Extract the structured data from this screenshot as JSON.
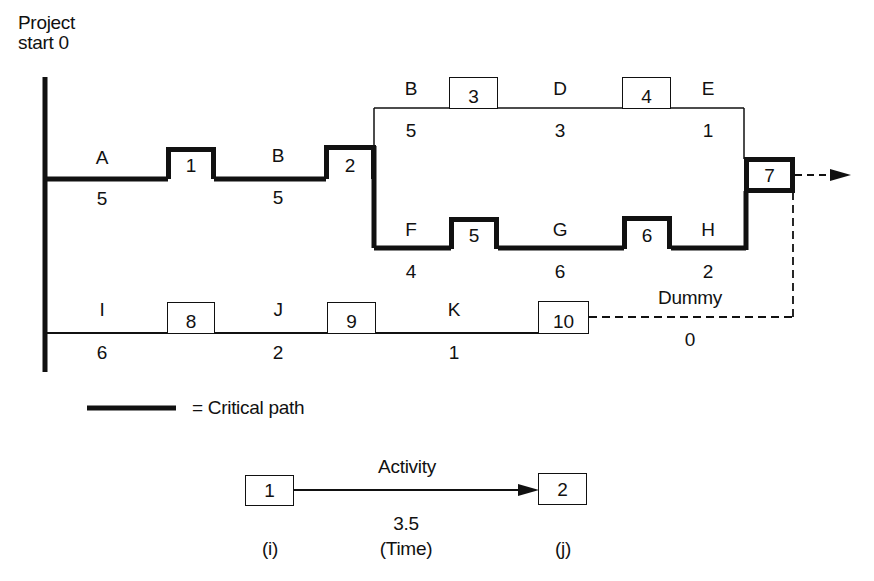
{
  "diagram": {
    "type": "PERT network (activity-on-arrow)",
    "start_label": "Project\nstart 0",
    "start_label_lines": [
      "Project",
      "start 0"
    ],
    "colors": {
      "line": "#111111",
      "background": "#ffffff"
    },
    "nodes": [
      {
        "id": "1",
        "label": "1",
        "critical": true
      },
      {
        "id": "2",
        "label": "2",
        "critical": true
      },
      {
        "id": "3",
        "label": "3",
        "critical": false
      },
      {
        "id": "4",
        "label": "4",
        "critical": false
      },
      {
        "id": "5",
        "label": "5",
        "critical": true
      },
      {
        "id": "6",
        "label": "6",
        "critical": true
      },
      {
        "id": "7",
        "label": "7",
        "critical": true
      },
      {
        "id": "8",
        "label": "8",
        "critical": false
      },
      {
        "id": "9",
        "label": "9",
        "critical": false
      },
      {
        "id": "10",
        "label": "10",
        "critical": false
      }
    ],
    "activities": [
      {
        "name": "A",
        "time": "5",
        "from": "start",
        "to": "1",
        "critical": true
      },
      {
        "name": "B",
        "time": "5",
        "from": "1",
        "to": "2",
        "critical": true
      },
      {
        "name": "B",
        "time": "5",
        "from": "2",
        "to": "3",
        "critical": false
      },
      {
        "name": "D",
        "time": "3",
        "from": "3",
        "to": "4",
        "critical": false
      },
      {
        "name": "E",
        "time": "1",
        "from": "4",
        "to": "7",
        "critical": false
      },
      {
        "name": "F",
        "time": "4",
        "from": "2",
        "to": "5",
        "critical": true
      },
      {
        "name": "G",
        "time": "6",
        "from": "5",
        "to": "6",
        "critical": true
      },
      {
        "name": "H",
        "time": "2",
        "from": "6",
        "to": "7",
        "critical": true
      },
      {
        "name": "I",
        "time": "6",
        "from": "start",
        "to": "8",
        "critical": false
      },
      {
        "name": "J",
        "time": "2",
        "from": "8",
        "to": "9",
        "critical": false
      },
      {
        "name": "K",
        "time": "1",
        "from": "9",
        "to": "10",
        "critical": false
      },
      {
        "name": "Dummy",
        "time": "0",
        "from": "10",
        "to": "7",
        "critical": false,
        "dashed": true
      }
    ],
    "legend": {
      "critical_path_label": "= Critical path",
      "example": {
        "from_node": "1",
        "to_node": "2",
        "activity_label": "Activity",
        "time_value": "3.5",
        "time_label": "(Time)",
        "from_caption": "(i)",
        "to_caption": "(j)"
      }
    }
  }
}
